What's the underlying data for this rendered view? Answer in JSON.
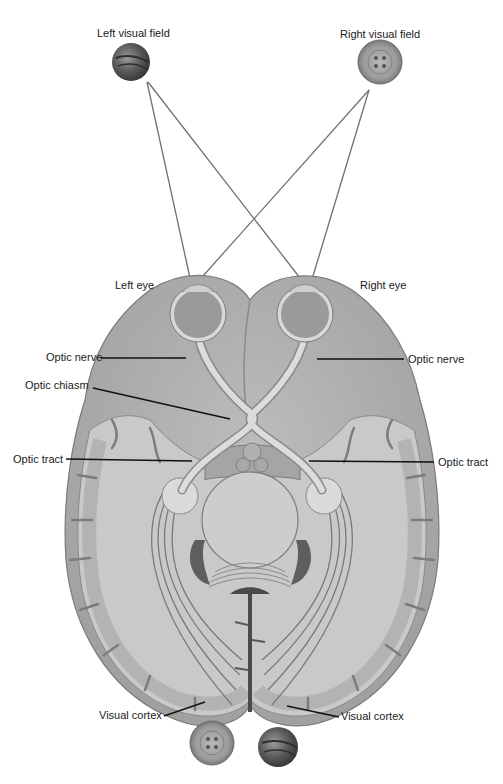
{
  "labels": {
    "left_visual_field": "Left visual field",
    "right_visual_field": "Right visual field",
    "left_eye": "Left eye",
    "right_eye": "Right eye",
    "optic_nerve_left": "Optic nerve",
    "optic_nerve_right": "Optic nerve",
    "optic_chiasm": "Optic chiasm",
    "optic_tract_left": "Optic tract",
    "optic_tract_right": "Optic tract",
    "visual_cortex_left": "Visual cortex",
    "visual_cortex_right": "Visual cortex"
  },
  "objects": {
    "left_field_object": "ball",
    "right_field_object": "button",
    "cortex_left_projection": "button",
    "cortex_right_projection": "ball"
  },
  "colors": {
    "background": "#ffffff",
    "brain_outer": "#9a9a9a",
    "brain_fill": "#b4b4b4",
    "white_matter": "#cfcfcf",
    "gray_matter": "#a8a8a8",
    "ray_line": "#6e6e6e",
    "leader_line": "#111111",
    "text": "#1a1a1a",
    "ventricle": "#5e5e5e"
  }
}
